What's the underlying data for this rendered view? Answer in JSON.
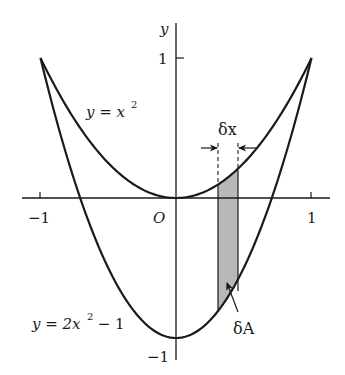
{
  "figure": {
    "axes": {
      "x_axis": {
        "tick_labels": [
          "−1",
          "1"
        ],
        "origin_label": "O"
      },
      "y_axis": {
        "label": "y",
        "tick_labels": [
          "1",
          "−1"
        ]
      }
    },
    "curves": [
      {
        "name": "upper",
        "label": "y = x²",
        "label_main": "y = x",
        "label_sup": "2",
        "equation": "y = x^2"
      },
      {
        "name": "lower",
        "label": "y = 2x² − 1",
        "label_main": "y = 2x",
        "label_sup": "2",
        "label_tail": " − 1",
        "equation": "y = 2x^2 - 1"
      }
    ],
    "strip": {
      "width_label": "δx",
      "area_label": "δA",
      "fill_color": "#b8b8b8"
    },
    "colors": {
      "line": "#1a1a1a",
      "background": "#ffffff"
    }
  },
  "chart_data": {
    "type": "line",
    "title": "",
    "xlabel": "",
    "ylabel": "y",
    "xlim": [
      -1.05,
      1.1
    ],
    "ylim": [
      -1.15,
      1.25
    ],
    "x_ticks": [
      -1,
      1
    ],
    "y_ticks": [
      1,
      -1
    ],
    "series": [
      {
        "name": "y = x^2",
        "x": [
          -1,
          -0.75,
          -0.5,
          -0.25,
          0,
          0.25,
          0.5,
          0.75,
          1
        ],
        "values": [
          1,
          0.5625,
          0.25,
          0.0625,
          0,
          0.0625,
          0.25,
          0.5625,
          1
        ]
      },
      {
        "name": "y = 2x^2 - 1",
        "x": [
          -1,
          -0.75,
          -0.5,
          -0.25,
          0,
          0.25,
          0.5,
          0.75,
          1
        ],
        "values": [
          1,
          0.125,
          -0.5,
          -0.875,
          -1,
          -0.875,
          -0.5,
          0.125,
          1
        ]
      }
    ],
    "annotations": [
      {
        "text": "δx",
        "type": "width-arrows",
        "x_range": [
          0.31,
          0.46
        ]
      },
      {
        "text": "δA",
        "type": "shaded-strip",
        "x_range": [
          0.31,
          0.46
        ]
      },
      {
        "text": "O",
        "type": "origin"
      }
    ],
    "grid": false,
    "legend": "none"
  }
}
